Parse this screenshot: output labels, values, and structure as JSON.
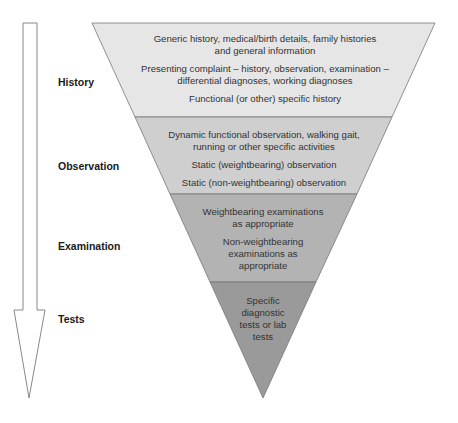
{
  "colors": {
    "band1": "#e6e6e6",
    "band2": "#cfcfcf",
    "band3": "#b3b3b3",
    "band4": "#9a9a9a",
    "outline": "#777777",
    "arrow_fill": "#ffffff",
    "arrow_stroke": "#888888"
  },
  "stages": [
    {
      "label": "History",
      "items": [
        "Generic history, medical/birth details, family histories and general information",
        "Presenting complaint – history, observation, examination – differential diagnoses, working diagnoses",
        "Functional (or other) specific history"
      ]
    },
    {
      "label": "Observation",
      "items": [
        "Dynamic functional observation, walking gait, running or other specific activities",
        "Static (weightbearing) observation",
        "Static (non-weightbearing) observation"
      ]
    },
    {
      "label": "Examination",
      "items": [
        "Weightbearing examinations as appropriate",
        "Non-weightbearing examinations as appropriate"
      ]
    },
    {
      "label": "Tests",
      "items": [
        "Specific diagnostic tests or lab tests"
      ]
    }
  ]
}
